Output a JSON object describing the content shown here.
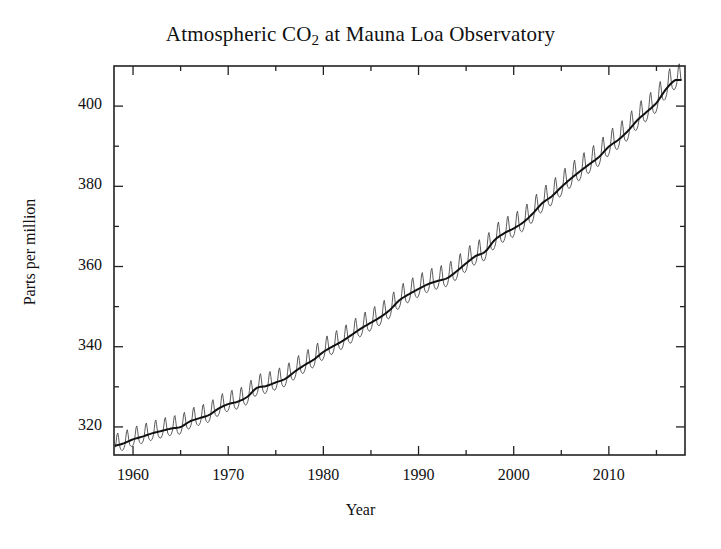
{
  "chart_data": {
    "type": "line",
    "title": "Atmospheric CO2 at Mauna Loa Observatory",
    "title_main": "Atmospheric CO",
    "title_sub": "2",
    "title_tail": " at Mauna Loa Observatory",
    "xlabel": "Year",
    "ylabel": "Parts per million",
    "xlim": [
      1958,
      2018
    ],
    "ylim": [
      313,
      410
    ],
    "grid": false,
    "legend": "none",
    "annotations": [
      "Scripps Institution of Oceanography",
      "NOAA Earth System Research Laboratory"
    ],
    "x_ticks_major": [
      1960,
      1970,
      1980,
      1990,
      2000,
      2010
    ],
    "x_ticks_minor": [
      1965,
      1975,
      1985,
      1995,
      2005,
      2015
    ],
    "y_ticks_major": [
      320,
      340,
      360,
      380,
      400
    ],
    "y_ticks_minor": [
      330,
      350,
      370,
      390
    ],
    "x_tick_labels": [
      "1960",
      "1970",
      "1980",
      "1990",
      "2000",
      "2010"
    ],
    "y_tick_labels": [
      "320",
      "340",
      "360",
      "380",
      "400"
    ],
    "colors": {
      "monthly_line": "#4a4a4a",
      "trend_line": "#111111",
      "axis": "#222222",
      "background": "#ffffff"
    },
    "seasonal_amplitude_ppm": 3.1,
    "series": [
      {
        "name": "Monthly mean CO2",
        "style": "thin sawtooth with seasonal cycle"
      },
      {
        "name": "Seasonally adjusted trend",
        "style": "thick smooth line",
        "x": [
          1958,
          1959,
          1960,
          1961,
          1962,
          1963,
          1964,
          1965,
          1966,
          1967,
          1968,
          1969,
          1970,
          1971,
          1972,
          1973,
          1974,
          1975,
          1976,
          1977,
          1978,
          1979,
          1980,
          1981,
          1982,
          1983,
          1984,
          1985,
          1986,
          1987,
          1988,
          1989,
          1990,
          1991,
          1992,
          1993,
          1994,
          1995,
          1996,
          1997,
          1998,
          1999,
          2000,
          2001,
          2002,
          2003,
          2004,
          2005,
          2006,
          2007,
          2008,
          2009,
          2010,
          2011,
          2012,
          2013,
          2014,
          2015,
          2016,
          2017
        ],
        "values": [
          315.3,
          315.9,
          316.9,
          317.6,
          318.4,
          319.0,
          319.6,
          320.0,
          321.4,
          322.2,
          323.0,
          324.6,
          325.7,
          326.3,
          327.5,
          329.7,
          330.2,
          331.1,
          332.0,
          333.8,
          335.4,
          336.8,
          338.7,
          340.1,
          341.4,
          343.0,
          344.6,
          346.0,
          347.4,
          349.2,
          351.6,
          353.1,
          354.4,
          355.6,
          356.4,
          357.1,
          358.8,
          360.8,
          362.6,
          363.7,
          366.6,
          368.3,
          369.5,
          371.0,
          373.2,
          375.8,
          377.5,
          379.8,
          381.9,
          383.8,
          385.6,
          387.4,
          389.9,
          391.6,
          393.8,
          396.5,
          398.6,
          400.8,
          404.2,
          406.5
        ]
      }
    ]
  }
}
